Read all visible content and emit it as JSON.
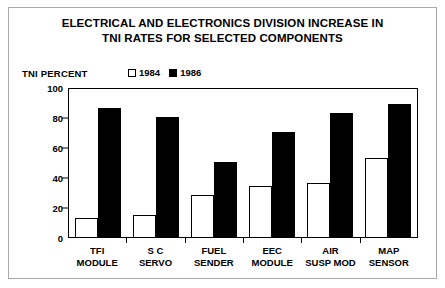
{
  "chart_data": {
    "type": "bar",
    "title": "ELECTRICAL AND ELECTRONICS DIVISION INCREASE IN TNI RATES FOR SELECTED COMPONENTS",
    "title_line1": "ELECTRICAL AND ELECTRONICS DIVISION INCREASE IN",
    "title_line2": "TNI RATES FOR SELECTED COMPONENTS",
    "ylabel": "TNI PERCENT",
    "xlabel": "",
    "categories": [
      "TFI MODULE",
      "S C SERVO",
      "FUEL SENDER",
      "EEC MODULE",
      "AIR SUSP MOD",
      "MAP SENSOR"
    ],
    "category_lines": [
      [
        "TFI",
        "MODULE"
      ],
      [
        "S C",
        "SERVO"
      ],
      [
        "FUEL",
        "SENDER"
      ],
      [
        "EEC",
        "MODULE"
      ],
      [
        "AIR",
        "SUSP MOD"
      ],
      [
        "MAP",
        "SENSOR"
      ]
    ],
    "series": [
      {
        "name": "1984",
        "values": [
          13,
          15,
          28,
          34,
          36,
          53
        ],
        "fill": "#ffffff",
        "edge": "#000000"
      },
      {
        "name": "1986",
        "values": [
          86,
          80,
          50,
          70,
          83,
          89
        ],
        "fill": "#000000",
        "edge": "#000000"
      }
    ],
    "ylim": [
      0,
      100
    ],
    "yticks": [
      0,
      20,
      40,
      60,
      80,
      100
    ],
    "ytick_labels": [
      "0",
      "20",
      "40",
      "60",
      "80",
      "100"
    ],
    "grid": false,
    "legend_position": "top-center"
  },
  "legend": {
    "items": [
      {
        "label": "1984",
        "marker": "hollow-square"
      },
      {
        "label": "1986",
        "marker": "filled-square"
      }
    ]
  },
  "colors": {
    "background": "#ffffff",
    "foreground": "#000000",
    "outer_frame": "#a8a8a8"
  }
}
